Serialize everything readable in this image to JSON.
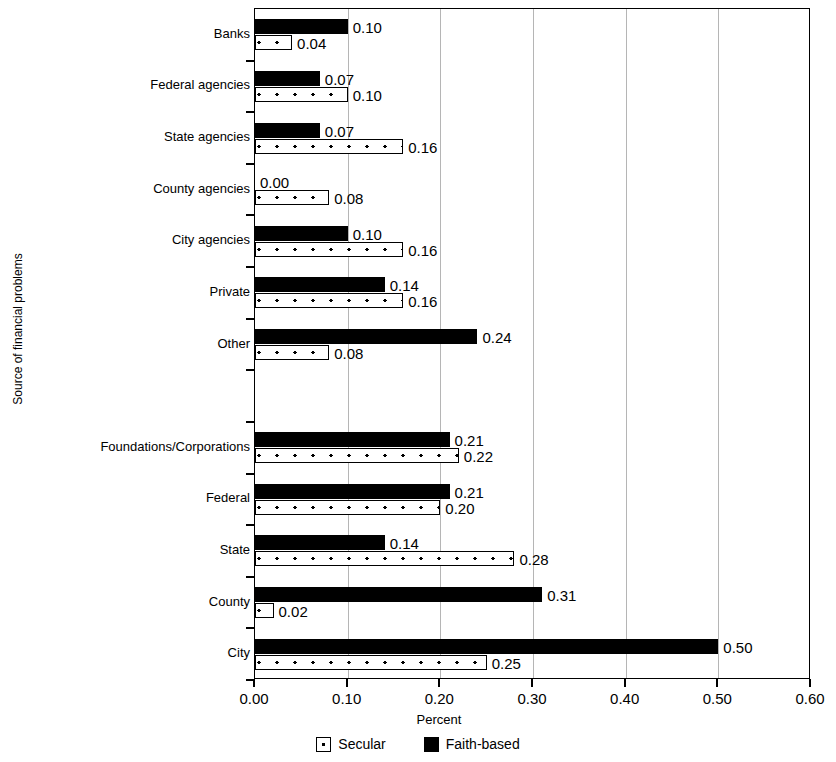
{
  "chart_data": {
    "type": "bar",
    "orientation": "horizontal",
    "title": "",
    "xlabel": "Percent",
    "ylabel": "Source of financial problems",
    "xlim": [
      0.0,
      0.6
    ],
    "xticks": [
      "0.00",
      "0.10",
      "0.20",
      "0.30",
      "0.40",
      "0.50",
      "0.60"
    ],
    "xtick_values": [
      0.0,
      0.1,
      0.2,
      0.3,
      0.4,
      0.5,
      0.6
    ],
    "grid": "vertical",
    "legend_position": "bottom",
    "categories": [
      "Banks",
      "Federal agencies",
      "State agencies",
      "County agencies",
      "City agencies",
      "Private",
      "Other",
      "",
      "Foundations/Corporations",
      "Federal",
      "State",
      "County",
      "City"
    ],
    "series": [
      {
        "name": "Faith-based",
        "style": "solid-black",
        "color": "#000000",
        "values": [
          0.1,
          0.07,
          0.07,
          0.0,
          0.1,
          0.14,
          0.24,
          null,
          0.21,
          0.21,
          0.14,
          0.31,
          0.5
        ],
        "labels": [
          "0.10",
          "0.07",
          "0.07",
          "0.00",
          "0.10",
          "0.14",
          "0.24",
          "",
          "0.21",
          "0.21",
          "0.14",
          "0.31",
          "0.50"
        ]
      },
      {
        "name": "Secular",
        "style": "white-dotted",
        "color": "#ffffff",
        "values": [
          0.04,
          0.1,
          0.16,
          0.08,
          0.16,
          0.16,
          0.08,
          null,
          0.22,
          0.2,
          0.28,
          0.02,
          0.25
        ],
        "labels": [
          "0.04",
          "0.10",
          "0.16",
          "0.08",
          "0.16",
          "0.16",
          "0.08",
          "",
          "0.22",
          "0.20",
          "0.28",
          "0.02",
          "0.25"
        ]
      }
    ]
  },
  "legend": {
    "items": [
      {
        "label": "Secular",
        "swatch": "white-dotted-square-icon"
      },
      {
        "label": "Faith-based",
        "swatch": "black-square-icon"
      }
    ]
  }
}
